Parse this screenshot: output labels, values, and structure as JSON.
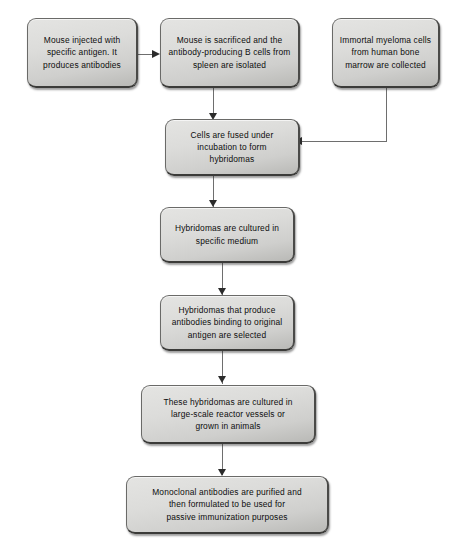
{
  "diagram": {
    "background_color": "#ffffff",
    "node_fill_color": "#dcdcda",
    "node_border_color": "#6a6a68",
    "text_color": "#0d0d0d",
    "connector_color": "#6e6e6e",
    "arrowhead_color": "#2b2b2b",
    "nodes": [
      {
        "id": "mouse-injected",
        "label": "Mouse injected with\nspecific antigen. It\nproduces antibodies"
      },
      {
        "id": "mouse-sacrificed",
        "label": "Mouse is sacrificed and the\nantibody-producing B cells from\nspleen are isolated"
      },
      {
        "id": "myeloma-cells",
        "label": "Immortal myeloma cells\nfrom human bone\nmarrow are collected"
      },
      {
        "id": "cells-fused",
        "label": "Cells are fused under\nincubation to form\nhybridomas"
      },
      {
        "id": "hybridomas-cultured",
        "label": "Hybridomas are cultured in\nspecific medium"
      },
      {
        "id": "hybridomas-selected",
        "label": "Hybridomas that produce\nantibodies binding to original\nantigen are selected"
      },
      {
        "id": "reactor-vessels",
        "label": "These hybridomas are cultured in\nlarge-scale reactor vessels or\ngrown in animals"
      },
      {
        "id": "antibodies-purified",
        "label": "Monoclonal antibodies are purified and\nthen formulated to be used for\npassive immunization purposes"
      }
    ],
    "edges": [
      {
        "id": "edge-injected-to-sacrificed",
        "from": "mouse-injected",
        "to": "mouse-sacrificed",
        "direction": "right"
      },
      {
        "id": "edge-sacrificed-to-fused",
        "from": "mouse-sacrificed",
        "to": "cells-fused",
        "direction": "down"
      },
      {
        "id": "edge-myeloma-to-fused",
        "from": "myeloma-cells",
        "to": "cells-fused",
        "direction": "down-then-left"
      },
      {
        "id": "edge-fused-to-cultured",
        "from": "cells-fused",
        "to": "hybridomas-cultured",
        "direction": "down"
      },
      {
        "id": "edge-cultured-to-selected",
        "from": "hybridomas-cultured",
        "to": "hybridomas-selected",
        "direction": "down"
      },
      {
        "id": "edge-selected-to-reactor",
        "from": "hybridomas-selected",
        "to": "reactor-vessels",
        "direction": "down"
      },
      {
        "id": "edge-reactor-to-purified",
        "from": "reactor-vessels",
        "to": "antibodies-purified",
        "direction": "down"
      }
    ]
  }
}
